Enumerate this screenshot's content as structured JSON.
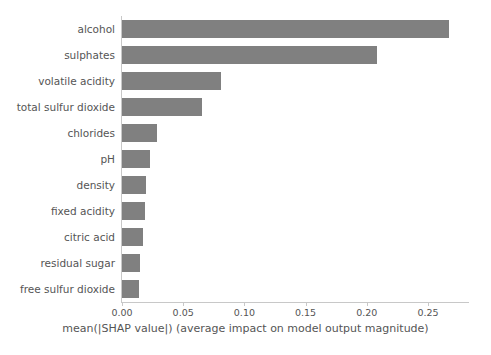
{
  "chart_data": {
    "type": "bar",
    "orientation": "horizontal",
    "title": "",
    "xlabel": "mean(|SHAP value|) (average impact on model output magnitude)",
    "ylabel": "",
    "categories": [
      "alcohol",
      "sulphates",
      "volatile acidity",
      "total sulfur dioxide",
      "chlorides",
      "pH",
      "density",
      "fixed acidity",
      "citric acid",
      "residual sugar",
      "free sulfur dioxide"
    ],
    "values": [
      0.267,
      0.208,
      0.081,
      0.065,
      0.029,
      0.023,
      0.02,
      0.019,
      0.017,
      0.015,
      0.014
    ],
    "xlim": [
      0.0,
      0.2835
    ],
    "xticks": [
      0.0,
      0.05,
      0.1,
      0.15,
      0.2,
      0.25
    ],
    "xtick_labels": [
      "0.00",
      "0.05",
      "0.10",
      "0.15",
      "0.20",
      "0.25"
    ],
    "grid": false,
    "legend": false,
    "bar_color": "#808080",
    "axis_color": "#c8c8c8",
    "text_color": "#555555",
    "background_color": "#ffffff"
  }
}
